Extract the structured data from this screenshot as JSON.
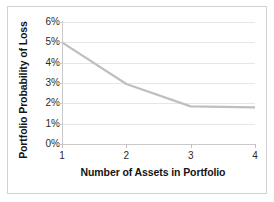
{
  "chart_data": {
    "type": "line",
    "title": "",
    "xlabel": "Number of Assets in Portfolio",
    "ylabel": "Portfolio Probability of Loss",
    "x": [
      1,
      2,
      3,
      4
    ],
    "xticklabels": [
      "1",
      "2",
      "3",
      "4"
    ],
    "yticklabels": [
      "0%",
      "1%",
      "2%",
      "3%",
      "4%",
      "5%",
      "6%"
    ],
    "ytickvalues": [
      0,
      1,
      2,
      3,
      4,
      5,
      6
    ],
    "xlim": [
      1,
      4
    ],
    "ylim": [
      0,
      6
    ],
    "grid": "horizontal",
    "legend": "none",
    "series": [
      {
        "name": "Portfolio Probability of Loss",
        "values": [
          5.0,
          2.95,
          1.85,
          1.8
        ],
        "color": "#bfbfbf",
        "linewidth": 2.2
      }
    ],
    "annotations": []
  },
  "style": {
    "background": "#ffffff",
    "frame_border": "#d2d2d2",
    "gridline_color": "#e6e6e6",
    "axis_color": "#c9c9c9",
    "tick_text_color": "#2a2a2a",
    "axis_title_color": "#141414"
  }
}
